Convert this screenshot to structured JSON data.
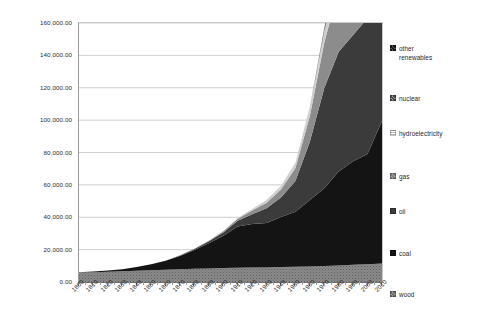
{
  "chart": {
    "type": "area",
    "title": "",
    "xlabel": "",
    "ylabel": ""
  },
  "y_axis": {
    "min": 0,
    "max": 160000,
    "step": 20000,
    "tick_labels": [
      "160,000.00",
      "140,000.00",
      "120,000.00",
      "100,000.00",
      "80,000.00",
      "60,000.00",
      "40,000.00",
      "20,000.00",
      "0.00"
    ]
  },
  "x_axis": {
    "min": 1800,
    "max": 2010,
    "step": 10,
    "tick_labels": [
      "1800",
      "1810",
      "1820",
      "1830",
      "1840",
      "1850",
      "1860",
      "1870",
      "1880",
      "1890",
      "1900",
      "1910",
      "1920",
      "1930",
      "1940",
      "1950",
      "1960",
      "1970",
      "1980",
      "1990",
      "2000",
      "2010"
    ]
  },
  "legend": {
    "position": "right",
    "items": [
      {
        "label": "other\nrenewables",
        "color": "#1c1c1c"
      },
      {
        "label": "nuclear",
        "color": "#6a6a6a"
      },
      {
        "label": "hydroelectricity",
        "color": "#c9c9c9"
      },
      {
        "label": "gas",
        "color": "#8d8d8d"
      },
      {
        "label": "oil",
        "color": "#3c3c3c"
      },
      {
        "label": "coal",
        "color": "#151515"
      },
      {
        "label": "wood",
        "color": "#7b7b7b"
      }
    ]
  },
  "chart_data": {
    "type": "area",
    "stacked": true,
    "title": "",
    "xlabel": "",
    "ylabel": "",
    "xlim": [
      1800,
      2010
    ],
    "ylim": [
      0,
      160000
    ],
    "grid": true,
    "legend_position": "right",
    "x": [
      1800,
      1810,
      1820,
      1830,
      1840,
      1850,
      1860,
      1870,
      1880,
      1890,
      1900,
      1910,
      1920,
      1930,
      1940,
      1950,
      1960,
      1970,
      1980,
      1990,
      2000,
      2010
    ],
    "series": [
      {
        "name": "wood",
        "color": "#7b7b7b",
        "values": [
          5800,
          6000,
          6300,
          6600,
          7000,
          7300,
          7600,
          7900,
          8200,
          8400,
          8600,
          8800,
          8900,
          9000,
          9200,
          9400,
          9600,
          9900,
          10200,
          10600,
          11000,
          11400
        ]
      },
      {
        "name": "coal",
        "color": "#151515",
        "values": [
          300,
          500,
          800,
          1300,
          2200,
          3600,
          5500,
          8200,
          11500,
          15500,
          20000,
          25500,
          27000,
          27500,
          31000,
          34000,
          41000,
          48000,
          58000,
          64000,
          68000,
          88000
        ]
      },
      {
        "name": "oil",
        "color": "#3c3c3c",
        "values": [
          0,
          0,
          0,
          0,
          0,
          0,
          100,
          300,
          700,
          1200,
          2000,
          3500,
          6000,
          9000,
          12000,
          19000,
          36000,
          62000,
          74000,
          78000,
          84000,
          89000
        ]
      },
      {
        "name": "gas",
        "color": "#8d8d8d",
        "values": [
          0,
          0,
          0,
          0,
          0,
          0,
          0,
          100,
          200,
          400,
          700,
          1200,
          2200,
          3500,
          5000,
          8000,
          16000,
          28000,
          39000,
          48000,
          57000,
          65000
        ]
      },
      {
        "name": "hydroelectricity",
        "color": "#c9c9c9",
        "values": [
          0,
          0,
          0,
          0,
          0,
          0,
          0,
          0,
          50,
          150,
          300,
          600,
          1000,
          1600,
          2200,
          3200,
          5000,
          7000,
          9000,
          11000,
          13000,
          15000
        ]
      },
      {
        "name": "nuclear",
        "color": "#6a6a6a",
        "values": [
          0,
          0,
          0,
          0,
          0,
          0,
          0,
          0,
          0,
          0,
          0,
          0,
          0,
          0,
          0,
          0,
          300,
          1800,
          6500,
          11000,
          13000,
          13500
        ]
      },
      {
        "name": "other renewables",
        "color": "#1c1c1c",
        "values": [
          0,
          0,
          0,
          0,
          0,
          0,
          0,
          0,
          0,
          0,
          0,
          0,
          0,
          0,
          0,
          0,
          100,
          300,
          700,
          1200,
          2000,
          4500
        ]
      }
    ],
    "totals": [
      6100,
      6500,
      7100,
      7900,
      9200,
      10900,
      13200,
      16500,
      20650,
      25650,
      31600,
      39600,
      45100,
      50600,
      59400,
      73600,
      108000,
      157000,
      197400,
      213800,
      248000,
      286400
    ]
  }
}
